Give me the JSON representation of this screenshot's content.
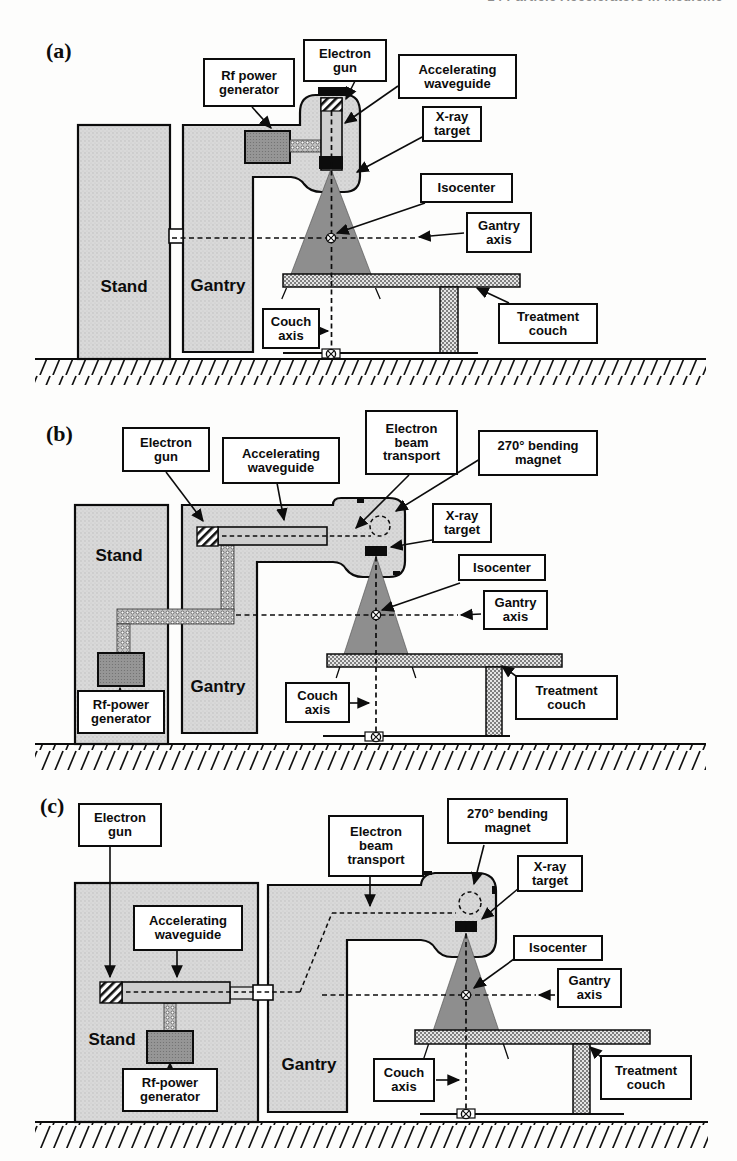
{
  "page": {
    "header_fragment": "14 Particle Accelerators in Medicine",
    "background": "#fdfdfc"
  },
  "colors": {
    "ink": "#0c0c0c",
    "machine_fill": "#d9d9d9",
    "beam_cone": "#8e8e8e",
    "rf_generator_fill": "#969696",
    "couch_pattern": "#7f7f7f",
    "label_background": "#ffffff"
  },
  "icons": {
    "isocenter_marker": "circle-with-cross",
    "arrow": "black-triangle-arrowhead"
  },
  "panels": [
    {
      "letter": "(a)",
      "labels": {
        "rf_power": "Rf power\ngenerator",
        "electron_gun": "Electron\ngun",
        "accelerating_waveguide": "Accelerating\nwaveguide",
        "xray_target": "X-ray\ntarget",
        "isocenter": "Isocenter",
        "gantry_axis": "Gantry\naxis",
        "couch_axis": "Couch\naxis",
        "treatment_couch": "Treatment\ncouch",
        "stand": "Stand",
        "gantry": "Gantry"
      }
    },
    {
      "letter": "(b)",
      "labels": {
        "electron_gun": "Electron\ngun",
        "accelerating_waveguide": "Accelerating\nwaveguide",
        "electron_beam_transport": "Electron\nbeam\ntransport",
        "bending_magnet": "270° bending\nmagnet",
        "xray_target": "X-ray\ntarget",
        "isocenter": "Isocenter",
        "gantry_axis": "Gantry\naxis",
        "couch_axis": "Couch\naxis",
        "treatment_couch": "Treatment\ncouch",
        "rf_power": "Rf-power\ngenerator",
        "stand": "Stand",
        "gantry": "Gantry"
      }
    },
    {
      "letter": "(c)",
      "labels": {
        "electron_gun": "Electron\ngun",
        "accelerating_waveguide": "Accelerating\nwaveguide",
        "electron_beam_transport": "Electron\nbeam\ntransport",
        "bending_magnet": "270° bending\nmagnet",
        "xray_target": "X-ray\ntarget",
        "isocenter": "Isocenter",
        "gantry_axis": "Gantry\naxis",
        "couch_axis": "Couch\naxis",
        "treatment_couch": "Treatment\ncouch",
        "rf_power": "Rf-power\ngenerator",
        "stand": "Stand",
        "gantry": "Gantry"
      }
    }
  ]
}
